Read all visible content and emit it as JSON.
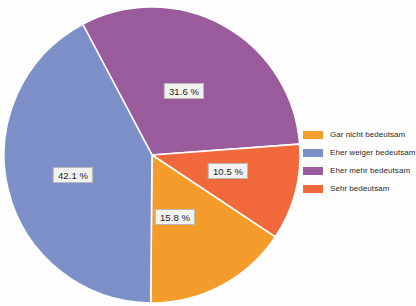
{
  "chart_data": {
    "type": "pie",
    "title": "",
    "categories": [
      "Gar nicht bedeutsam",
      "Eher weiger bedeutsam",
      "Eher mehr bedeutsam",
      "Sehr bedeutsam"
    ],
    "values": [
      15.8,
      42.1,
      31.6,
      10.5
    ],
    "value_labels": [
      "15.8 %",
      "42.1 %",
      "31.6 %",
      "10.5 %"
    ],
    "unit": "%",
    "colors": [
      "#F59D2B",
      "#7E90C9",
      "#9A5C9C",
      "#F2693C"
    ],
    "legend_position": "right",
    "grid": false,
    "slices": [
      {
        "label": "Eher mehr bedeutsam",
        "value": 31.6,
        "value_label": "31.6 %",
        "color": "#9A5C9C",
        "start_deg": -28.0,
        "sweep_deg": 113.8,
        "label_x": 184,
        "label_y": 91
      },
      {
        "label": "Sehr bedeutsam",
        "value": 10.5,
        "value_label": "10.5 %",
        "color": "#F2693C",
        "start_deg": 85.8,
        "sweep_deg": 37.8,
        "label_x": 228,
        "label_y": 171
      },
      {
        "label": "Gar nicht bedeutsam",
        "value": 15.8,
        "value_label": "15.8 %",
        "color": "#F59D2B",
        "start_deg": 123.6,
        "sweep_deg": 56.9,
        "label_x": 175,
        "label_y": 217
      },
      {
        "label": "Eher weiger bedeutsam",
        "value": 42.1,
        "value_label": "42.1 %",
        "color": "#7E90C9",
        "start_deg": 180.5,
        "sweep_deg": 151.6,
        "label_x": 73,
        "label_y": 175
      }
    ],
    "geometry": {
      "center_x": 152,
      "center_y": 155,
      "radius": 148
    }
  },
  "legend": {
    "items": [
      {
        "label": "Gar nicht bedeutsam",
        "color": "#F59D2B"
      },
      {
        "label": "Eher weiger bedeutsam",
        "color": "#7E90C9"
      },
      {
        "label": "Eher mehr bedeutsam",
        "color": "#9A5C9C"
      },
      {
        "label": "Sehr bedeutsam",
        "color": "#F2693C"
      }
    ]
  }
}
